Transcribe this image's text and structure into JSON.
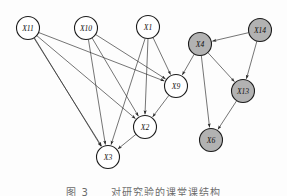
{
  "figure": {
    "caption": "图 3　　对研究验的课堂课结构",
    "background_color": "#fdfdfd",
    "edge_color": "#2a2a2a",
    "node_stroke_color": "#1c1c1c",
    "node_fill_observed": "#ffffff",
    "node_fill_latent": "#b2b2b2",
    "node_radius": 11.5
  },
  "graph": {
    "type": "directed-acyclic-graph",
    "node_count": 9,
    "edge_count": 18,
    "nodes": [
      {
        "id": "X11",
        "label": "X11",
        "x": 28,
        "y": 28,
        "shaded": false
      },
      {
        "id": "X10",
        "label": "X10",
        "x": 86,
        "y": 28,
        "shaded": false
      },
      {
        "id": "X1",
        "label": "X1",
        "x": 148,
        "y": 27,
        "shaded": false
      },
      {
        "id": "X4",
        "label": "X4",
        "x": 200,
        "y": 44,
        "shaded": true
      },
      {
        "id": "X14",
        "label": "X14",
        "x": 260,
        "y": 30,
        "shaded": true
      },
      {
        "id": "X9",
        "label": "X9",
        "x": 176,
        "y": 86,
        "shaded": false
      },
      {
        "id": "X13",
        "label": "X13",
        "x": 243,
        "y": 91,
        "shaded": true
      },
      {
        "id": "X2",
        "label": "X2",
        "x": 145,
        "y": 127,
        "shaded": false
      },
      {
        "id": "X6",
        "label": "X6",
        "x": 211,
        "y": 140,
        "shaded": true
      },
      {
        "id": "X3",
        "label": "X3",
        "x": 108,
        "y": 157,
        "shaded": false
      }
    ],
    "edges": [
      {
        "from": "X11",
        "to": "X9"
      },
      {
        "from": "X11",
        "to": "X2"
      },
      {
        "from": "X11",
        "to": "X3"
      },
      {
        "from": "X11",
        "to": "X3b"
      },
      {
        "from": "X10",
        "to": "X9"
      },
      {
        "from": "X10",
        "to": "X2"
      },
      {
        "from": "X10",
        "to": "X3"
      },
      {
        "from": "X1",
        "to": "X9"
      },
      {
        "from": "X1",
        "to": "X2"
      },
      {
        "from": "X1",
        "to": "X3"
      },
      {
        "from": "X9",
        "to": "X2"
      },
      {
        "from": "X2",
        "to": "X3"
      },
      {
        "from": "X4",
        "to": "X9"
      },
      {
        "from": "X4",
        "to": "X13"
      },
      {
        "from": "X4",
        "to": "X6"
      },
      {
        "from": "X14",
        "to": "X4"
      },
      {
        "from": "X14",
        "to": "X13"
      },
      {
        "from": "X13",
        "to": "X6"
      }
    ]
  }
}
